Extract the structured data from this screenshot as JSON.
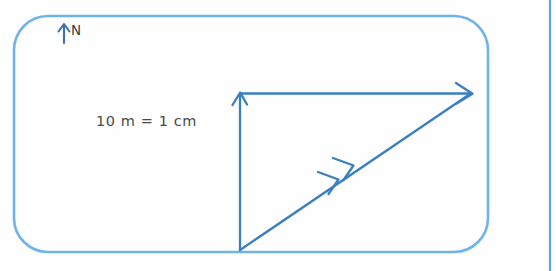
{
  "figure": {
    "kind": "vector-diagram",
    "background_color": "#fefefe",
    "border": {
      "color": "#6fb4e8",
      "shape": "rounded-rectangle",
      "stroke_width": 2.6
    },
    "page_edge_line": {
      "color": "#5aa6e0",
      "orientation": "vertical"
    }
  },
  "compass": {
    "label": "N",
    "icon": "north-arrow-icon",
    "color": "#3f6fb0"
  },
  "scale": {
    "text": "10 m = 1 cm"
  },
  "vectors": {
    "color": "#3a7fc0",
    "items": [
      {
        "name": "vertical-vector",
        "direction": "north",
        "arrowheads": 1,
        "from": [
          240,
          250
        ],
        "to": [
          240,
          93
        ]
      },
      {
        "name": "horizontal-vector",
        "direction": "east",
        "arrowheads": 1,
        "from": [
          240,
          93
        ],
        "to": [
          472,
          93
        ]
      },
      {
        "name": "resultant-vector",
        "direction": "north-east",
        "arrowheads": 2,
        "from": [
          240,
          250
        ],
        "to": [
          472,
          93
        ]
      }
    ]
  }
}
